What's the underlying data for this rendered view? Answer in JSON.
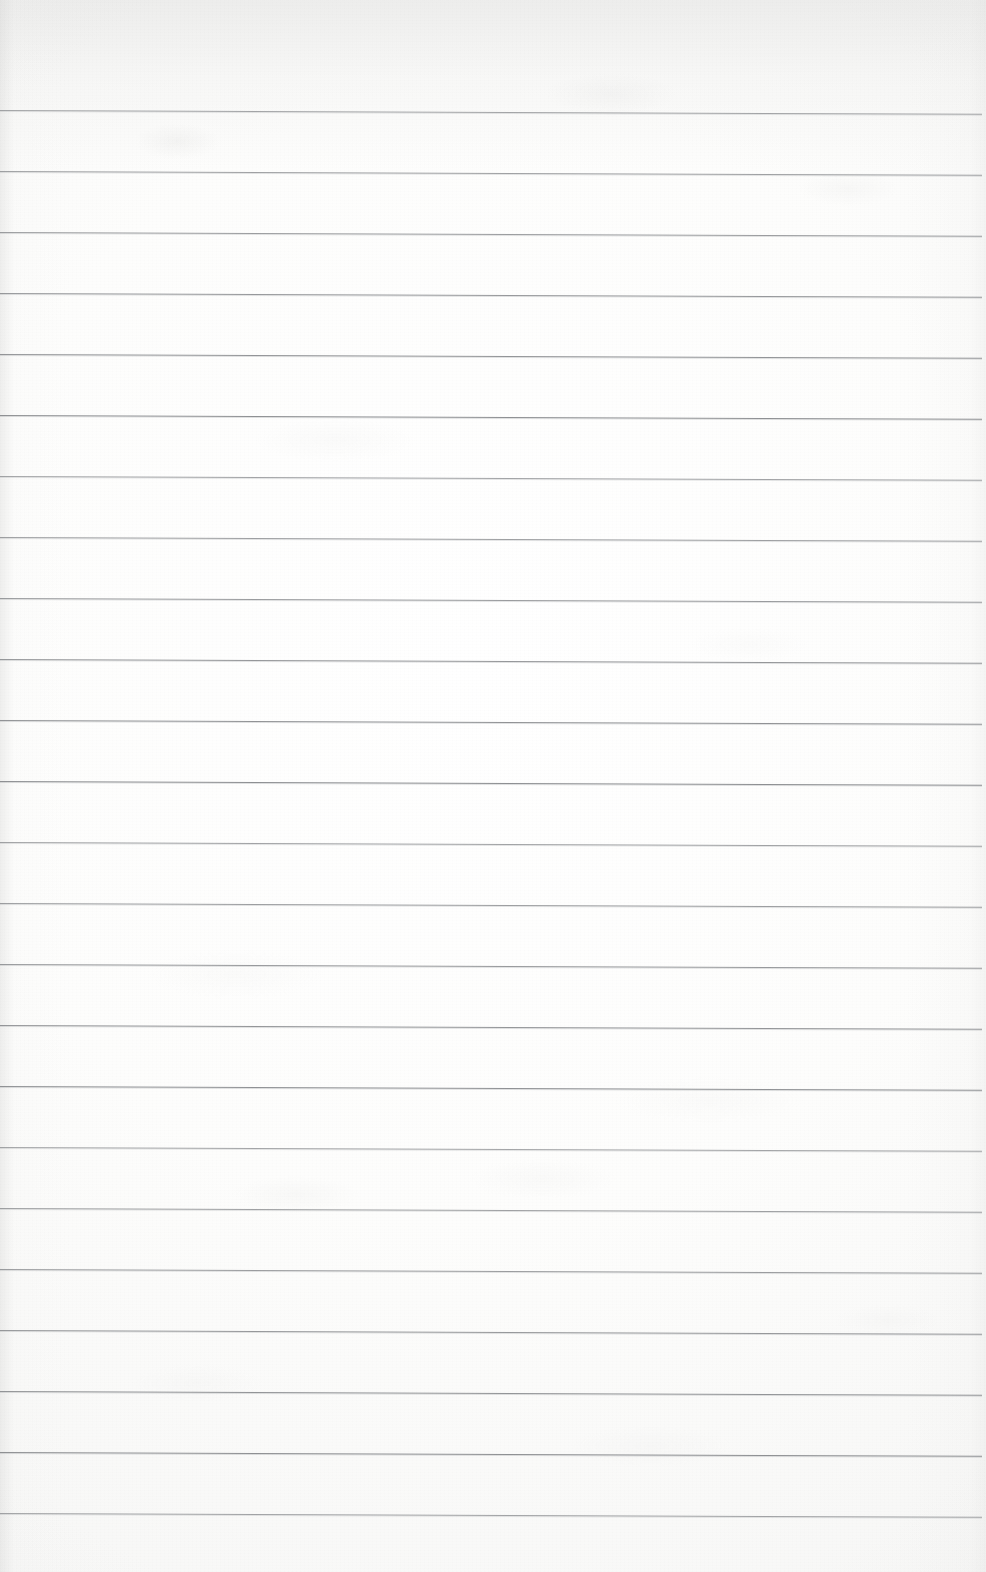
{
  "document": {
    "kind": "scanned-lined-paper",
    "title": "Blank ruled notebook page (scan)",
    "page_width": 986,
    "page_height": 1572,
    "text_content": "",
    "has_handwriting": false,
    "has_printed_text": false
  },
  "paper": {
    "background_color": "#fbfbfa",
    "highlight_color": "#ffffff",
    "shadow_color": "#f0f0ef",
    "texture": "fine scanner grain with soft mottling",
    "top_shade": true,
    "vignette": true
  },
  "ruling": {
    "line_color": "#8d8f92",
    "line_thickness": 1,
    "line_count": 24,
    "first_line_y": 110,
    "line_spacing": 61,
    "left_inset": 0,
    "right_end_x": 982,
    "skew_degrees": 0.22,
    "margin_line": false,
    "line_positions_y": [
      110,
      171,
      232,
      293,
      354,
      415,
      476,
      537,
      598,
      659,
      720,
      781,
      842,
      903,
      964,
      1025,
      1086,
      1147,
      1208,
      1269,
      1330,
      1391,
      1452,
      1513
    ]
  }
}
